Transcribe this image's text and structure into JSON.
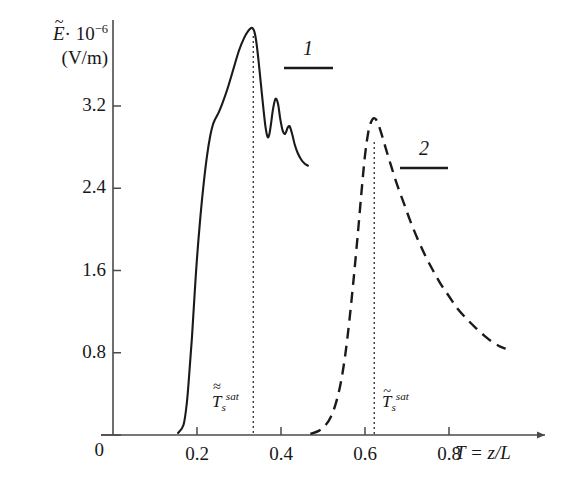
{
  "chart_data": {
    "type": "line",
    "title": "",
    "ylabel_line1": "E· 10",
    "ylabel_exp": "-6",
    "ylabel_line2": "(V/m)",
    "xlabel": "T = z/L",
    "xlim": [
      0,
      1.0
    ],
    "ylim": [
      0,
      4.1
    ],
    "grid": false,
    "legend_position": "inside-right",
    "xticks": [
      0,
      0.2,
      0.4,
      0.6,
      0.8
    ],
    "xticklabels": [
      "0",
      "0.2",
      "0.4",
      "0.6",
      "0.8"
    ],
    "yticks": [
      0,
      0.8,
      1.6,
      2.4,
      3.2
    ],
    "yticklabels": [
      "0",
      "0.8",
      "1.6",
      "2.4",
      "3.2"
    ],
    "series": [
      {
        "name": "1",
        "label": "1",
        "style": "solid",
        "color": "#1a1a1a",
        "x": [
          0.155,
          0.168,
          0.176,
          0.182,
          0.188,
          0.194,
          0.2,
          0.208,
          0.216,
          0.224,
          0.232,
          0.238,
          0.243,
          0.247,
          0.252,
          0.26,
          0.272,
          0.286,
          0.3,
          0.312,
          0.322,
          0.33,
          0.336,
          0.341,
          0.346,
          0.352,
          0.358,
          0.363,
          0.368,
          0.372,
          0.376,
          0.381,
          0.387,
          0.393,
          0.398,
          0.404,
          0.41,
          0.416,
          0.421,
          0.427,
          0.433,
          0.44,
          0.448,
          0.456,
          0.464
        ],
        "y": [
          0.02,
          0.1,
          0.32,
          0.62,
          0.95,
          1.35,
          1.72,
          2.12,
          2.45,
          2.72,
          2.92,
          3.02,
          3.07,
          3.1,
          3.14,
          3.22,
          3.36,
          3.55,
          3.74,
          3.86,
          3.93,
          3.96,
          3.93,
          3.83,
          3.66,
          3.42,
          3.18,
          3.0,
          2.9,
          2.92,
          3.02,
          3.17,
          3.27,
          3.22,
          3.08,
          2.96,
          2.93,
          2.99,
          3.0,
          2.92,
          2.82,
          2.74,
          2.68,
          2.64,
          2.62
        ]
      },
      {
        "name": "2",
        "label": "2",
        "style": "dashed",
        "color": "#1a1a1a",
        "x": [
          0.47,
          0.49,
          0.505,
          0.518,
          0.53,
          0.542,
          0.553,
          0.563,
          0.573,
          0.583,
          0.592,
          0.6,
          0.608,
          0.614,
          0.62,
          0.626,
          0.632,
          0.64,
          0.65,
          0.662,
          0.676,
          0.692,
          0.708,
          0.726,
          0.744,
          0.762,
          0.78,
          0.8,
          0.82,
          0.842,
          0.864,
          0.886,
          0.905,
          0.922,
          0.935
        ],
        "y": [
          0.01,
          0.04,
          0.09,
          0.17,
          0.3,
          0.5,
          0.78,
          1.12,
          1.52,
          1.96,
          2.38,
          2.72,
          2.95,
          3.04,
          3.08,
          3.07,
          3.02,
          2.92,
          2.78,
          2.62,
          2.44,
          2.26,
          2.08,
          1.9,
          1.74,
          1.6,
          1.47,
          1.35,
          1.23,
          1.13,
          1.04,
          0.96,
          0.9,
          0.86,
          0.84
        ]
      }
    ],
    "annotations": [
      {
        "name": "sat-marker-1",
        "x": 0.334,
        "type": "vertical-dotted-line",
        "label_base": "T",
        "label_sub": "s",
        "label_sup": "sat",
        "accent": "double-tilde"
      },
      {
        "name": "sat-marker-2",
        "x": 0.622,
        "type": "vertical-dotted-line",
        "label_base": "T",
        "label_sub": "s",
        "label_sup": "sat",
        "accent": "single-tilde"
      }
    ]
  },
  "axes": {
    "y_title_main": "E",
    "y_title_rest": "· 10",
    "y_title_exponent": "−6",
    "y_title_units": "(V/m)",
    "x_title": "T = z/L"
  },
  "colors": {
    "axis": "#4a4a4a",
    "curve": "#1a1a1a",
    "text": "#171717",
    "background": "#ffffff"
  }
}
